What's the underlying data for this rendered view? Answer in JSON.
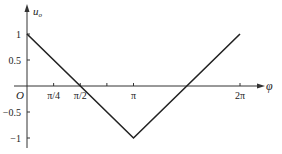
{
  "chart_data": {
    "type": "line",
    "title": "",
    "xlabel": "φ",
    "ylabel": "u_o",
    "origin_label": "O",
    "xlim": [
      0,
      6.6
    ],
    "ylim": [
      -1.2,
      1.3
    ],
    "grid": false,
    "legend": null,
    "x_ticks": [
      {
        "value": 0.7854,
        "label": "π/4"
      },
      {
        "value": 1.5708,
        "label": "π/2"
      },
      {
        "value": 2.3562,
        "label": ""
      },
      {
        "value": 3.1416,
        "label": "π"
      },
      {
        "value": 6.2832,
        "label": "2π"
      }
    ],
    "y_ticks": [
      {
        "value": 1,
        "label": "1"
      },
      {
        "value": 0.5,
        "label": "0.5"
      },
      {
        "value": -0.5,
        "label": "−0.5"
      },
      {
        "value": -1,
        "label": "−1"
      }
    ],
    "series": [
      {
        "name": "u_o",
        "x": [
          0,
          1.5708,
          3.1416,
          4.7124,
          6.2832
        ],
        "y": [
          1,
          0,
          -1,
          0,
          1
        ]
      }
    ]
  },
  "labels": {
    "y_axis": "u",
    "y_axis_sub": "o",
    "x_axis": "φ",
    "origin": "O"
  }
}
